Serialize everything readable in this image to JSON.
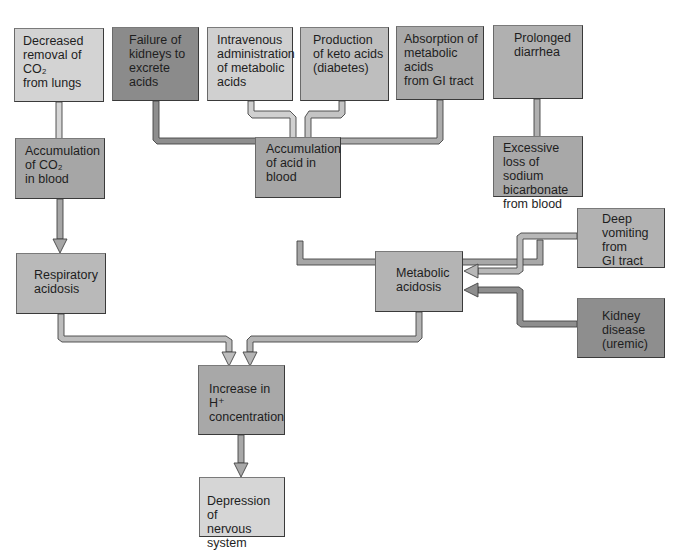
{
  "diagram": {
    "type": "flowchart",
    "topic": "Causes of acidosis",
    "nodes": [
      {
        "id": "co2_removal",
        "label": "Decreased\nremoval of\nCO₂\nfrom lungs",
        "fill": "#d3d3d3",
        "x": 14,
        "y": 28,
        "w": 90,
        "h": 74
      },
      {
        "id": "kidney_failure",
        "label": "Failure of\nkidneys to\nexcrete\nacids",
        "fill": "#8b8b8b",
        "x": 112,
        "y": 27,
        "w": 87,
        "h": 74
      },
      {
        "id": "iv_admin",
        "label": "Intravenous\nadministration\nof metabolic\nacids",
        "fill": "#d0d0d0",
        "x": 207,
        "y": 27,
        "w": 86,
        "h": 74
      },
      {
        "id": "keto_acids",
        "label": "Production\nof keto acids\n(diabetes)",
        "fill": "#bebebe",
        "x": 300,
        "y": 27,
        "w": 89,
        "h": 74
      },
      {
        "id": "gi_absorption",
        "label": "Absorption of\nmetabolic acids\nfrom GI tract",
        "fill": "#a9a9a9",
        "x": 396,
        "y": 26,
        "w": 88,
        "h": 74
      },
      {
        "id": "diarrhea",
        "label": "Prolonged\ndiarrhea",
        "fill": "#b0b0b0",
        "x": 493,
        "y": 25,
        "w": 90,
        "h": 74
      },
      {
        "id": "co2_accum",
        "label": "Accumulation\nof CO₂\nin blood",
        "fill": "#a6a6a6",
        "x": 15,
        "y": 138,
        "w": 90,
        "h": 61
      },
      {
        "id": "acid_accum",
        "label": "Accumulation\nof acid in\nblood",
        "fill": "#a6a6a6",
        "x": 255,
        "y": 137,
        "w": 86,
        "h": 61
      },
      {
        "id": "bicarb_loss",
        "label": "Excessive\nloss of sodium\nbicarbonate\nfrom blood",
        "fill": "#a8a8a8",
        "x": 493,
        "y": 136,
        "w": 90,
        "h": 61
      },
      {
        "id": "vomiting",
        "label": "Deep\nvomiting\nfrom\nGI tract",
        "fill": "#b2b2b2",
        "x": 577,
        "y": 208,
        "w": 88,
        "h": 60
      },
      {
        "id": "resp_acidosis",
        "label": "Respiratory\nacidosis",
        "fill": "#b9b9b9",
        "x": 16,
        "y": 253,
        "w": 90,
        "h": 61
      },
      {
        "id": "metab_acidosis",
        "label": "Metabolic\nacidosis",
        "fill": "#b4b4b4",
        "x": 375,
        "y": 251,
        "w": 88,
        "h": 61
      },
      {
        "id": "kidney_disease",
        "label": "Kidney\ndisease\n(uremic)",
        "fill": "#8e8e8e",
        "x": 577,
        "y": 298,
        "w": 88,
        "h": 60
      },
      {
        "id": "h_increase",
        "label": "Increase in H⁺\nconcentration",
        "fill": "#a8a8a8",
        "x": 198,
        "y": 365,
        "w": 87,
        "h": 70
      },
      {
        "id": "cns_depression",
        "label": "Depression of\nnervous system",
        "fill": "#d6d6d6",
        "x": 199,
        "y": 477,
        "w": 86,
        "h": 60
      }
    ],
    "edges": [
      {
        "from": "co2_removal",
        "to": "co2_accum",
        "fill": "#d6d6d6"
      },
      {
        "from": "kidney_failure",
        "to": "acid_accum",
        "fill": "#8e8e8e"
      },
      {
        "from": "iv_admin",
        "to": "acid_accum",
        "fill": "#d0d0d0"
      },
      {
        "from": "keto_acids",
        "to": "acid_accum",
        "fill": "#c4c4c4"
      },
      {
        "from": "gi_absorption",
        "to": "acid_accum",
        "fill": "#acacac"
      },
      {
        "from": "diarrhea",
        "to": "bicarb_loss",
        "fill": "#b0b0b0"
      },
      {
        "from": "co2_accum",
        "to": "resp_acidosis",
        "fill": "#a6a6a6"
      },
      {
        "from": "acid_accum",
        "to": "metab_acidosis",
        "fill": "#a6a6a6"
      },
      {
        "from": "bicarb_loss",
        "to": "metab_acidosis",
        "fill": "#a8a8a8"
      },
      {
        "from": "vomiting",
        "to": "metab_acidosis",
        "fill": "#b8b8b8"
      },
      {
        "from": "kidney_disease",
        "to": "metab_acidosis",
        "fill": "#8e8e8e"
      },
      {
        "from": "resp_acidosis",
        "to": "h_increase",
        "fill": "#bdbdbd"
      },
      {
        "from": "metab_acidosis",
        "to": "h_increase",
        "fill": "#b4b4b4"
      },
      {
        "from": "h_increase",
        "to": "cns_depression",
        "fill": "#a8a8a8"
      }
    ]
  }
}
